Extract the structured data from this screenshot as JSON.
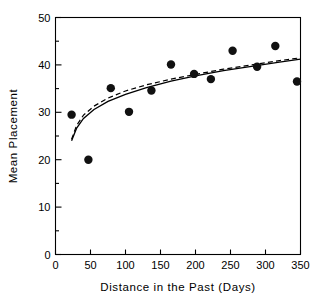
{
  "chart_data": {
    "type": "scatter",
    "title": "",
    "xlabel": "Distance in the Past (Days)",
    "ylabel": "Mean Placement",
    "xlim": [
      0,
      350
    ],
    "ylim": [
      0,
      50
    ],
    "xticks": [
      0,
      50,
      100,
      150,
      200,
      250,
      300,
      350
    ],
    "xtick_labels": [
      "0",
      "50",
      "100",
      "150",
      "200",
      "250",
      "300",
      "350"
    ],
    "yticks": [
      0,
      10,
      20,
      30,
      40,
      50
    ],
    "ytick_labels": [
      "0",
      "10",
      "20",
      "30",
      "40",
      "50"
    ],
    "y_minor_ticks": [
      5,
      15,
      25,
      35,
      45
    ],
    "grid": false,
    "legend": "none",
    "points": [
      {
        "x": 23,
        "y": 29.5
      },
      {
        "x": 47,
        "y": 20.0
      },
      {
        "x": 79,
        "y": 35.1
      },
      {
        "x": 105,
        "y": 30.1
      },
      {
        "x": 137,
        "y": 34.6
      },
      {
        "x": 165,
        "y": 40.1
      },
      {
        "x": 198,
        "y": 38.1
      },
      {
        "x": 222,
        "y": 37.0
      },
      {
        "x": 253,
        "y": 43.0
      },
      {
        "x": 288,
        "y": 39.6
      },
      {
        "x": 314,
        "y": 44.0
      },
      {
        "x": 345,
        "y": 36.5
      }
    ],
    "series": [
      {
        "name": "solid-fit",
        "style": "solid",
        "x": [
          23,
          30,
          40,
          55,
          75,
          100,
          130,
          165,
          200,
          240,
          280,
          320,
          350
        ],
        "y": [
          24.0,
          26.6,
          28.7,
          30.6,
          32.3,
          33.8,
          35.2,
          36.6,
          37.7,
          38.8,
          39.7,
          40.6,
          41.2
        ]
      },
      {
        "name": "dashed-fit",
        "style": "dashed",
        "x": [
          23,
          30,
          40,
          55,
          75,
          100,
          130,
          165,
          200,
          240,
          280,
          320,
          350
        ],
        "y": [
          24.3,
          27.2,
          29.4,
          31.3,
          33.0,
          34.5,
          35.8,
          37.0,
          38.0,
          39.1,
          40.0,
          40.9,
          41.5
        ]
      }
    ],
    "marker_size_px": 4.2,
    "colors": {
      "axis": "#000000",
      "marker": "#111111",
      "fit_line": "#000000",
      "background": "#ffffff"
    }
  }
}
